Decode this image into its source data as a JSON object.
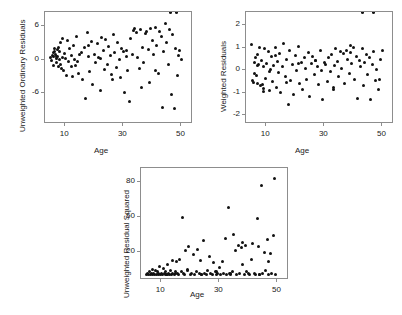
{
  "figure": {
    "background": "#ffffff",
    "marker_color": "#111111",
    "axis_color": "#8d8d8d"
  },
  "chart_data": [
    {
      "type": "scatter",
      "panel": "a)",
      "title": "",
      "xlabel": "Age",
      "ylabel": "Unweighted Ordinary Residuals",
      "xlim": [
        3,
        54
      ],
      "ylim": [
        -11.5,
        8.5
      ],
      "xticks": [
        10,
        30,
        50
      ],
      "yticks": [
        6,
        0,
        -6
      ],
      "grid": false,
      "legend": "none",
      "x": [
        5.0,
        5.2,
        5.5,
        5.8,
        6.0,
        6.2,
        6.4,
        6.6,
        6.8,
        7.0,
        7.2,
        7.4,
        7.6,
        7.8,
        8.0,
        8.2,
        8.5,
        8.8,
        9.0,
        9.3,
        9.6,
        10.0,
        10.4,
        10.8,
        11.2,
        11.6,
        12.0,
        12.4,
        12.8,
        13.2,
        13.6,
        14.0,
        14.5,
        15.0,
        15.5,
        16.0,
        16.5,
        17.0,
        17.5,
        18.0,
        18.5,
        19.0,
        19.5,
        20.0,
        20.5,
        21.0,
        21.5,
        22.0,
        22.5,
        23.0,
        23.5,
        24.0,
        24.5,
        25.0,
        25.5,
        26.0,
        26.5,
        27.0,
        27.5,
        28.0,
        28.5,
        29.0,
        29.5,
        30.0,
        30.5,
        31.0,
        31.5,
        32.0,
        32.5,
        33.0,
        33.5,
        34.0,
        34.5,
        35.0,
        35.5,
        36.0,
        36.5,
        37.0,
        37.5,
        38.0,
        38.5,
        39.0,
        39.5,
        40.0,
        40.5,
        41.0,
        41.5,
        42.0,
        42.5,
        43.0,
        43.5,
        44.0,
        44.5,
        45.0,
        45.5,
        46.0,
        46.5,
        47.0,
        47.5,
        48.0,
        48.5,
        49.0,
        49.5,
        50.0,
        6.1,
        7.1,
        8.1,
        9.1,
        12.1,
        14.1,
        18.1,
        22.1,
        26.1,
        31.1,
        36.1,
        41.1,
        46.1,
        48.2
      ],
      "y": [
        0.3,
        -0.2,
        0.8,
        1.2,
        0.5,
        1.5,
        2.0,
        1.0,
        0.2,
        -0.5,
        1.8,
        0.6,
        -1.2,
        2.2,
        0.1,
        -0.8,
        3.0,
        -1.5,
        0.4,
        -2.0,
        1.1,
        0.2,
        -2.8,
        3.5,
        -0.4,
        1.9,
        0.7,
        -3.0,
        2.6,
        0.0,
        -1.0,
        4.2,
        -2.5,
        0.9,
        1.3,
        -3.5,
        2.1,
        -7.0,
        4.8,
        0.5,
        -2.2,
        3.2,
        -4.5,
        1.0,
        -0.6,
        2.8,
        0.3,
        -5.5,
        4.0,
        1.6,
        -1.8,
        3.6,
        -0.9,
        2.4,
        0.8,
        -2.6,
        4.4,
        1.2,
        -1.4,
        3.0,
        0.0,
        -3.2,
        2.0,
        1.5,
        -5.8,
        0.6,
        -2.0,
        -7.5,
        3.8,
        1.0,
        5.2,
        5.6,
        4.9,
        0.4,
        -1.6,
        5.4,
        2.2,
        -0.5,
        4.6,
        5.0,
        1.8,
        -4.0,
        5.5,
        3.4,
        0.9,
        5.8,
        2.6,
        -2.4,
        5.1,
        4.2,
        -8.5,
        1.4,
        6.4,
        3.0,
        -0.8,
        5.3,
        -6.2,
        4.4,
        -8.8,
        2.0,
        -2.8,
        0.8,
        1.6,
        0.0,
        -1.0,
        0.6,
        1.4,
        3.8,
        -1.2,
        -0.3,
        2.5,
        0.2,
        -3.6,
        1.7,
        -5.0,
        -1.9
      ]
    },
    {
      "type": "scatter",
      "panel": "b)",
      "title": "",
      "xlabel": "Age",
      "ylabel": "Weighted Residuals",
      "xlim": [
        3,
        54
      ],
      "ylim": [
        -2.4,
        2.6
      ],
      "xticks": [
        10,
        30,
        50
      ],
      "yticks": [
        2,
        1,
        0,
        -1,
        -2
      ],
      "grid": false,
      "legend": "none",
      "x": [
        5.0,
        5.3,
        5.6,
        5.9,
        6.2,
        6.5,
        6.8,
        7.1,
        7.4,
        7.7,
        8.0,
        8.3,
        8.6,
        8.9,
        9.2,
        9.5,
        9.8,
        10.2,
        10.6,
        11.0,
        11.4,
        11.8,
        12.2,
        12.6,
        13.0,
        13.4,
        13.8,
        14.2,
        14.6,
        15.0,
        15.5,
        16.0,
        16.5,
        17.0,
        17.5,
        18.0,
        18.5,
        19.0,
        19.5,
        20.0,
        20.5,
        21.0,
        21.5,
        22.0,
        22.5,
        23.0,
        23.5,
        24.0,
        24.5,
        25.0,
        25.5,
        26.0,
        26.5,
        27.0,
        27.5,
        28.0,
        28.5,
        29.0,
        29.5,
        30.0,
        30.5,
        31.0,
        31.5,
        32.0,
        32.5,
        33.0,
        33.5,
        34.0,
        34.5,
        35.0,
        35.5,
        36.0,
        36.5,
        37.0,
        37.5,
        38.0,
        38.5,
        39.0,
        39.5,
        40.0,
        40.5,
        41.0,
        41.5,
        42.0,
        42.5,
        43.0,
        43.5,
        44.0,
        44.5,
        45.0,
        45.5,
        46.0,
        46.5,
        47.0,
        47.5,
        48.0,
        48.5,
        49.0,
        49.5,
        50.0,
        6.0,
        7.0,
        9.0,
        11.0,
        13.0,
        17.0,
        21.0,
        27.0,
        33.0,
        39.0,
        43.0,
        47.0
      ],
      "y": [
        1.15,
        -0.45,
        -0.55,
        0.35,
        0.55,
        -0.25,
        0.7,
        -0.6,
        0.25,
        1.0,
        -0.7,
        0.45,
        -0.65,
        0.15,
        -0.8,
        0.95,
        -0.35,
        0.3,
        0.85,
        -0.9,
        0.05,
        0.6,
        -0.5,
        0.2,
        1.0,
        -0.75,
        0.4,
        -0.1,
        0.75,
        -1.0,
        0.15,
        1.2,
        -0.3,
        0.5,
        -1.55,
        0.9,
        -0.45,
        0.25,
        -1.1,
        0.65,
        0.0,
        1.05,
        -0.6,
        0.35,
        -0.85,
        0.55,
        0.1,
        -0.4,
        0.8,
        -1.15,
        0.3,
        0.6,
        -0.2,
        0.45,
        0.15,
        -0.65,
        0.9,
        0.0,
        -1.3,
        0.35,
        0.25,
        -0.5,
        0.55,
        -0.05,
        0.7,
        -0.85,
        0.2,
        0.95,
        0.4,
        -0.3,
        0.85,
        0.1,
        0.75,
        -0.6,
        0.9,
        0.5,
        -0.15,
        0.8,
        0.3,
        1.0,
        -0.4,
        0.6,
        -1.25,
        0.45,
        0.15,
        0.95,
        -0.7,
        0.35,
        0.7,
        -0.2,
        0.55,
        -1.3,
        0.25,
        0.85,
        -0.45,
        0.05,
        -0.85,
        -0.4,
        0.5,
        0.9,
        -0.15,
        0.2,
        -0.95,
        -0.05,
        0.65,
        -0.55,
        0.3,
        0.45,
        -0.75,
        1.1
      ]
    },
    {
      "type": "scatter",
      "panel": "c)",
      "title": "",
      "xlabel": "Age",
      "ylabel": "Unweighted Residual Squared",
      "xlim": [
        3,
        54
      ],
      "ylim": [
        -4,
        92
      ],
      "xticks": [
        10,
        30,
        50
      ],
      "yticks": [
        80,
        50,
        20
      ],
      "grid": false,
      "legend": "none",
      "x": [
        5.0,
        5.3,
        5.6,
        5.9,
        6.2,
        6.5,
        6.8,
        7.1,
        7.4,
        7.7,
        8.0,
        8.3,
        8.6,
        8.9,
        9.2,
        9.5,
        9.8,
        10.1,
        10.4,
        10.7,
        11.0,
        11.3,
        11.6,
        11.9,
        12.2,
        12.5,
        12.8,
        13.1,
        13.4,
        13.7,
        14.0,
        14.4,
        14.8,
        15.2,
        15.6,
        16.0,
        16.4,
        16.8,
        17.2,
        17.6,
        18.0,
        18.5,
        19.0,
        19.5,
        20.0,
        20.5,
        21.0,
        21.5,
        22.0,
        22.5,
        23.0,
        23.5,
        24.0,
        24.5,
        25.0,
        25.5,
        26.0,
        26.5,
        27.0,
        27.5,
        28.0,
        28.5,
        29.0,
        29.5,
        30.0,
        30.5,
        31.0,
        31.5,
        32.0,
        32.5,
        33.0,
        33.5,
        34.0,
        34.5,
        35.0,
        35.5,
        36.0,
        36.5,
        37.0,
        37.5,
        38.0,
        38.5,
        39.0,
        39.5,
        40.0,
        40.5,
        41.0,
        41.5,
        42.0,
        42.5,
        43.0,
        43.5,
        44.0,
        44.5,
        45.0,
        45.5,
        46.0,
        46.5,
        47.0,
        47.5,
        48.0,
        48.5,
        49.0,
        49.5,
        12.0,
        15.0,
        19.0,
        24.0,
        29.0,
        34.0,
        38.0,
        44.0,
        47.0
      ],
      "y": [
        1,
        2,
        1,
        3,
        1,
        2,
        5,
        1,
        2,
        1,
        4,
        1,
        3,
        1,
        2,
        8,
        1,
        2,
        1,
        6,
        2,
        1,
        3,
        1,
        9,
        2,
        1,
        4,
        1,
        2,
        13,
        1,
        3,
        12,
        2,
        1,
        14,
        3,
        50,
        2,
        1,
        21,
        5,
        25,
        1,
        2,
        18,
        1,
        3,
        22,
        2,
        13,
        1,
        30,
        2,
        1,
        4,
        16,
        2,
        1,
        11,
        3,
        1,
        2,
        7,
        1,
        12,
        2,
        32,
        1,
        58,
        2,
        1,
        3,
        35,
        21,
        1,
        26,
        2,
        24,
        28,
        1,
        26,
        3,
        2,
        1,
        14,
        27,
        2,
        1,
        49,
        25,
        1,
        77,
        2,
        20,
        4,
        31,
        1,
        19,
        2,
        34,
        83,
        1,
        1,
        2,
        4,
        1,
        3,
        2,
        9,
        1,
        12
      ]
    }
  ]
}
